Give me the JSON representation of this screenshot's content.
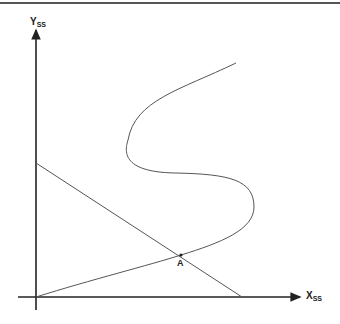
{
  "diagram": {
    "y_axis": {
      "label": "Y",
      "subscript": "SS"
    },
    "x_axis": {
      "label": "X",
      "subscript": "SS"
    },
    "point": {
      "label": "A"
    },
    "curves": [
      {
        "name": "s-shaped curve",
        "description": "starts at origin, rises through A, bends right, then left, then up-right"
      },
      {
        "name": "straight line",
        "description": "declining line from y-axis to x-axis, crossing curve at A"
      }
    ]
  }
}
